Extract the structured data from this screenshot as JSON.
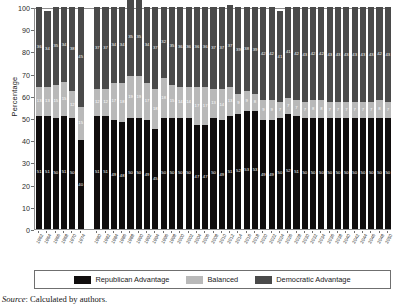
{
  "chart_data": {
    "type": "bar",
    "subtype": "stacked-percentage",
    "title": "",
    "xlabel": "",
    "ylabel": "Percentage",
    "ylim": [
      0,
      100
    ],
    "ytick_values": [
      0,
      10,
      20,
      30,
      40,
      50,
      60,
      70,
      80,
      90,
      100
    ],
    "grid": false,
    "legend_position": "bottom",
    "stack_order": [
      "Republican Advantage",
      "Balanced",
      "Democratic Advantage"
    ],
    "categories": [
      "1962",
      "1964",
      "1966",
      "1968",
      "1970",
      "1974",
      "1980",
      "1982",
      "1984",
      "1986",
      "1988",
      "1990",
      "1992",
      "1994",
      "1996",
      "1998",
      "2000",
      "2002",
      "2004",
      "2006",
      "2008",
      "2010",
      "2012",
      "2014",
      "2016",
      "2018",
      "2020",
      "2022",
      "2024",
      "2026",
      "2028",
      "2030",
      "2032",
      "2034",
      "2036",
      "2038",
      "2040",
      "2042",
      "2044",
      "2046",
      "2048",
      "2050"
    ],
    "series": [
      {
        "name": "Republican Advantage",
        "color": "#100d0d",
        "values": [
          51,
          51,
          50,
          51,
          50,
          40,
          51,
          51,
          49,
          48,
          50,
          50,
          49,
          45,
          50,
          50,
          50,
          50,
          47,
          47,
          50,
          49,
          51,
          52,
          53,
          53,
          49,
          49,
          50,
          52,
          51,
          50,
          50,
          50,
          50,
          50,
          50,
          50,
          50,
          50,
          50,
          50
        ]
      },
      {
        "name": "Balanced",
        "color": "#b9b9b9",
        "values": [
          13,
          13,
          15,
          15,
          12,
          15,
          12,
          12,
          17,
          18,
          19,
          19,
          17,
          18,
          18,
          15,
          14,
          14,
          17,
          17,
          13,
          14,
          13,
          9,
          9,
          8,
          9,
          9,
          7,
          7,
          7,
          7,
          8,
          8,
          7,
          7,
          7,
          7,
          7,
          7,
          8,
          7
        ]
      },
      {
        "name": "Democratic Advantage",
        "color": "#4a4a4a",
        "values": [
          36,
          34,
          35,
          34,
          38,
          45,
          37,
          37,
          34,
          34,
          35,
          35,
          34,
          37,
          32,
          35,
          36,
          36,
          36,
          36,
          37,
          37,
          37,
          39,
          38,
          39,
          42,
          42,
          41,
          41,
          42,
          43,
          42,
          42,
          43,
          43,
          43,
          43,
          43,
          43,
          42,
          43
        ]
      }
    ]
  },
  "legend": {
    "items": [
      {
        "label": "Republican Advantage",
        "color": "#100d0d"
      },
      {
        "label": "Balanced",
        "color": "#b9b9b9"
      },
      {
        "label": "Democratic Advantage",
        "color": "#4a4a4a"
      }
    ]
  },
  "source": {
    "prefix": "Source",
    "separator": ":",
    "text": "Calculated by authors."
  },
  "gap_after_index": 5
}
